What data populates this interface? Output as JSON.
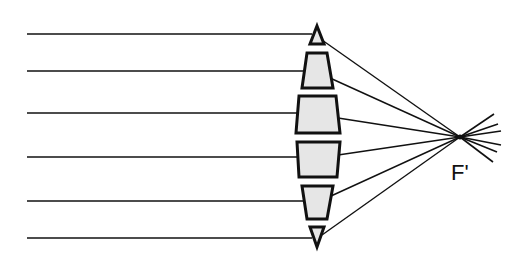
{
  "diagram": {
    "focal_label": "F'",
    "colors": {
      "line": "#111111",
      "prism_fill": "#e6e6e6",
      "background": "#ffffff"
    },
    "focal_point": [
      460,
      137
    ],
    "incoming_rays": [
      {
        "x1": 27,
        "y": 34,
        "x2": 312
      },
      {
        "x1": 27,
        "y": 71,
        "x2": 305
      },
      {
        "x1": 27,
        "y": 113,
        "x2": 298
      },
      {
        "x1": 27,
        "y": 157,
        "x2": 298
      },
      {
        "x1": 27,
        "y": 201,
        "x2": 305
      },
      {
        "x1": 27,
        "y": 238,
        "x2": 312
      }
    ],
    "outgoing_rays": [
      {
        "from": [
          322,
          40
        ],
        "beyond": [
          494,
          114
        ]
      },
      {
        "from": [
          330,
          78
        ],
        "beyond": [
          498,
          124
        ]
      },
      {
        "from": [
          338,
          118
        ],
        "beyond": [
          501,
          131
        ]
      },
      {
        "from": [
          338,
          155
        ],
        "beyond": [
          501,
          145
        ]
      },
      {
        "from": [
          331,
          196
        ],
        "beyond": [
          497,
          152
        ]
      },
      {
        "from": [
          322,
          235
        ],
        "beyond": [
          493,
          162
        ]
      }
    ],
    "prisms": [
      {
        "name": "prism-top-triangle",
        "points": "317,26 324,44 310,44"
      },
      {
        "name": "prism-2",
        "points": "307,53 327,53 333,88 302,88"
      },
      {
        "name": "prism-3",
        "points": "299,96 336,96 340,133 296,133"
      },
      {
        "name": "prism-4",
        "points": "297,142 340,142 337,177 299,177"
      },
      {
        "name": "prism-5",
        "points": "302,186 333,186 327,219 307,219"
      },
      {
        "name": "prism-bottom-triangle",
        "points": "310,227 324,227 317,247"
      }
    ]
  }
}
